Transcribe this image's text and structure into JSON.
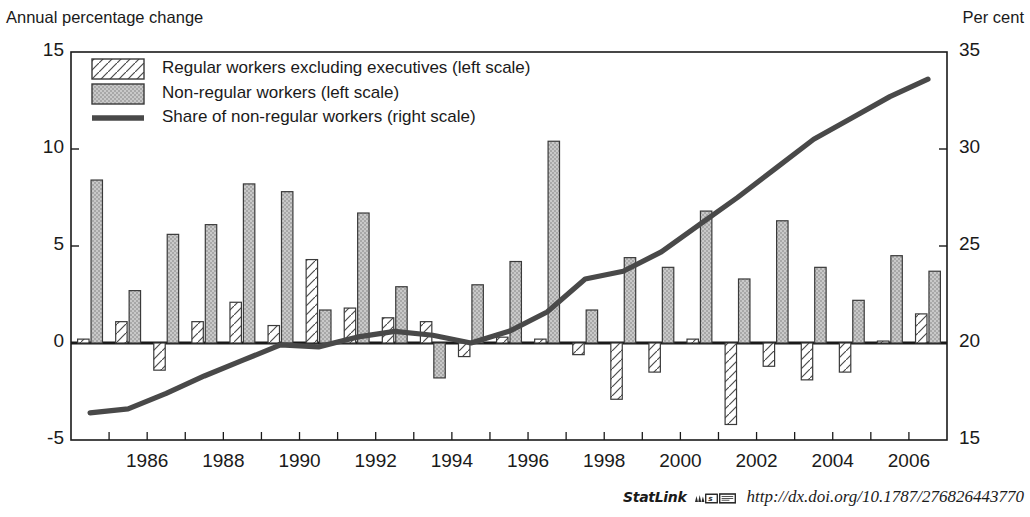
{
  "axes": {
    "left_title": "Annual percentage change",
    "right_title": "Per cent",
    "left_ticks": [
      "15",
      "10",
      "5",
      "0",
      "-5"
    ],
    "right_ticks": [
      "35",
      "30",
      "25",
      "20",
      "15"
    ],
    "x_ticks": [
      "1986",
      "1988",
      "1990",
      "1992",
      "1994",
      "1996",
      "1998",
      "2000",
      "2002",
      "2004",
      "2006"
    ]
  },
  "legend": {
    "items": [
      {
        "label": "Regular workers excluding executives (left scale)",
        "swatch": "hatched-box-swatch"
      },
      {
        "label": "Non-regular workers (left scale)",
        "swatch": "stippled-box-swatch"
      },
      {
        "label": "Share of non-regular workers (right scale)",
        "swatch": "thick-line-swatch"
      }
    ]
  },
  "footer": {
    "statlink_label": "StatLink",
    "statlink_glyph": "statlink-icon",
    "url": "http://dx.doi.org/10.1787/276826443770"
  },
  "colors": {
    "regular_fill": "#ffffff",
    "regular_stroke": "#3a3a3a",
    "nonregular_fill": "#b9b9b9",
    "nonregular_stroke": "#3a3a3a",
    "line": "#494949",
    "axis": "#1a1a1a",
    "text": "#1a1a1a"
  },
  "chart_data": {
    "type": "bar",
    "title": "",
    "xlabel": "",
    "ylabel": "Annual percentage change",
    "y2label": "Per cent",
    "ylim": [
      -5,
      15
    ],
    "y2lim": [
      15,
      35
    ],
    "grid": false,
    "legend_position": "top-left",
    "x": [
      1985,
      1986,
      1987,
      1988,
      1989,
      1990,
      1991,
      1992,
      1993,
      1994,
      1995,
      1996,
      1997,
      1998,
      1999,
      2000,
      2001,
      2002,
      2003,
      2004,
      2005,
      2006,
      2007
    ],
    "categories": [
      "1985",
      "1986",
      "1987",
      "1988",
      "1989",
      "1990",
      "1991",
      "1992",
      "1993",
      "1994",
      "1995",
      "1996",
      "1997",
      "1998",
      "1999",
      "2000",
      "2001",
      "2002",
      "2003",
      "2004",
      "2005",
      "2006",
      "2007"
    ],
    "series": [
      {
        "name": "Regular workers excluding executives (left scale)",
        "type": "bar",
        "axis": "left",
        "values": [
          0.2,
          1.1,
          -1.4,
          1.1,
          2.1,
          0.9,
          4.3,
          1.8,
          1.3,
          1.1,
          -0.7,
          0.3,
          0.2,
          -0.6,
          -2.9,
          -1.5,
          0.2,
          -4.2,
          -1.2,
          -1.9,
          -1.5,
          0.1,
          1.5
        ]
      },
      {
        "name": "Non-regular workers (left scale)",
        "type": "bar",
        "axis": "left",
        "values": [
          8.4,
          2.7,
          5.6,
          6.1,
          8.2,
          7.8,
          1.7,
          6.7,
          2.9,
          -1.8,
          3.0,
          4.2,
          10.4,
          1.7,
          4.4,
          3.9,
          6.8,
          3.3,
          6.3,
          3.9,
          2.2,
          4.5,
          3.7
        ]
      },
      {
        "name": "Share of non-regular workers (right scale)",
        "type": "line",
        "axis": "right",
        "values": [
          16.4,
          16.6,
          17.4,
          18.3,
          19.1,
          19.9,
          19.8,
          20.3,
          20.6,
          20.4,
          20.0,
          20.6,
          21.6,
          23.3,
          23.7,
          24.7,
          26.1,
          27.5,
          29.0,
          30.5,
          31.6,
          32.7,
          33.6
        ]
      }
    ]
  }
}
